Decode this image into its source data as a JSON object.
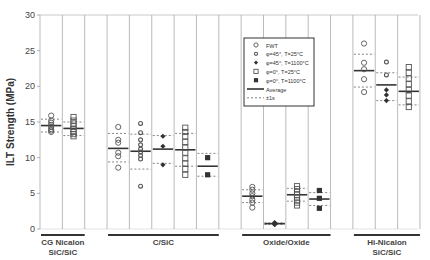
{
  "chart_data": {
    "type": "scatter",
    "title": "",
    "xlabel": "",
    "ylabel": "ILT Strength (MPa)",
    "ylim": [
      0,
      30
    ],
    "yticks": [
      0,
      5,
      10,
      15,
      20,
      25,
      30
    ],
    "grid": "vertical column dividers",
    "legend_position": "upper-center (inside plot)",
    "legend": [
      {
        "marker": "open-circle",
        "label": "FWT"
      },
      {
        "marker": "open-diamond",
        "label": "φ=45°, T=25°C"
      },
      {
        "marker": "filled-diamond",
        "label": "φ=45°, T=1100°C"
      },
      {
        "marker": "open-square",
        "label": "φ=0°, T=25°C"
      },
      {
        "marker": "filled-square",
        "label": "φ=0°, T=1100°C"
      },
      {
        "marker": "solid-line",
        "label": "Average"
      },
      {
        "marker": "dotted-line",
        "label": "±1s"
      }
    ],
    "groups": [
      {
        "label_line1": "CG Nicalon",
        "label_line2": "SiC/SiC",
        "col_start": 0,
        "col_end": 2
      },
      {
        "label_line1": "C/SiC",
        "label_line2": "",
        "col_start": 3,
        "col_end": 8
      },
      {
        "label_line1": "Oxide/Oxide",
        "label_line2": "",
        "col_start": 9,
        "col_end": 13
      },
      {
        "label_line1": "Hi-Nicalon",
        "label_line2": "SiC/SiC",
        "col_start": 14,
        "col_end": 17
      }
    ],
    "series": [
      {
        "group": "CG Nicalon SiC/SiC",
        "col": 0,
        "marker": "open-circle",
        "values": [
          15.9,
          15.2,
          14.9,
          14.6,
          14.3,
          14.0,
          13.8,
          13.6
        ],
        "average": 14.5,
        "plus1s": 15.4,
        "minus1s": 13.6
      },
      {
        "group": "CG Nicalon SiC/SiC",
        "col": 1,
        "marker": "open-square",
        "values": [
          15.7,
          15.2,
          14.8,
          14.4,
          14.0,
          13.6,
          13.3,
          13.0
        ],
        "average": 14.1,
        "plus1s": 15.0,
        "minus1s": 13.1
      },
      {
        "group": "C/SiC",
        "col": 3,
        "marker": "open-circle",
        "values": [
          14.3,
          12.5,
          12.1,
          10.7,
          10.2,
          8.6
        ],
        "average": 11.3,
        "plus1s": 13.4,
        "minus1s": 9.4
      },
      {
        "group": "C/SiC",
        "col": 4,
        "marker": "open-diamond",
        "values": [
          14.8,
          13.5,
          12.5,
          11.8,
          11.2,
          10.8,
          10.3,
          9.8,
          6.0
        ],
        "average": 10.9,
        "plus1s": 13.3,
        "minus1s": 8.4
      },
      {
        "group": "C/SiC",
        "col": 5,
        "marker": "filled-diamond",
        "values": [
          13.0,
          11.6,
          9.0
        ],
        "average": 11.2,
        "plus1s": 13.1,
        "minus1s": 9.2
      },
      {
        "group": "C/SiC",
        "col": 6,
        "marker": "open-square",
        "values": [
          14.2,
          13.6,
          13.0,
          12.2,
          11.4,
          10.7,
          9.9,
          9.2,
          8.4,
          7.6
        ],
        "average": 11.1,
        "plus1s": 13.4,
        "minus1s": 8.8
      },
      {
        "group": "C/SiC",
        "col": 7,
        "marker": "filled-square",
        "values": [
          10.0,
          7.6
        ],
        "average": 8.8,
        "plus1s": 10.6,
        "minus1s": 7.4
      },
      {
        "group": "Oxide/Oxide",
        "col": 9,
        "marker": "open-circle",
        "values": [
          5.9,
          5.5,
          5.0,
          4.6,
          4.1,
          3.7,
          3.0
        ],
        "average": 4.6,
        "plus1s": 5.5,
        "minus1s": 3.7
      },
      {
        "group": "Oxide/Oxide",
        "col": 10,
        "marker": "filled-diamond",
        "values": [
          0.9,
          0.8,
          0.7,
          0.6
        ],
        "average": 0.75,
        "plus1s": 0.85,
        "minus1s": 0.65
      },
      {
        "group": "Oxide/Oxide",
        "col": 11,
        "marker": "open-square",
        "values": [
          6.0,
          5.6,
          5.2,
          4.8,
          4.4,
          4.0,
          3.7,
          3.3
        ],
        "average": 4.8,
        "plus1s": 5.7,
        "minus1s": 3.9
      },
      {
        "group": "Oxide/Oxide",
        "col": 12,
        "marker": "filled-square",
        "values": [
          5.4,
          4.3,
          2.9
        ],
        "average": 4.2,
        "plus1s": 5.1,
        "minus1s": 3.3
      },
      {
        "group": "Hi-Nicalon SiC/SiC",
        "col": 14,
        "marker": "open-circle",
        "values": [
          26.0,
          23.3,
          22.4,
          21.0,
          19.2
        ],
        "average": 22.2,
        "plus1s": 24.5,
        "minus1s": 19.9
      },
      {
        "group": "Hi-Nicalon SiC/SiC",
        "col": 15,
        "marker": "open-diamond",
        "values": [
          23.4,
          21.6
        ],
        "average": 20.2,
        "plus1s": 21.9,
        "minus1s": 18.0
      },
      {
        "group": "Hi-Nicalon SiC/SiC",
        "col": 15,
        "marker": "filled-diamond",
        "values": [
          19.5,
          18.8,
          18.0
        ]
      },
      {
        "group": "Hi-Nicalon SiC/SiC",
        "col": 16,
        "marker": "open-square",
        "values": [
          22.7,
          21.9,
          21.1,
          20.3,
          19.5,
          18.7,
          17.9,
          17.1
        ],
        "average": 19.3,
        "plus1s": 21.3,
        "minus1s": 17.4
      }
    ]
  }
}
